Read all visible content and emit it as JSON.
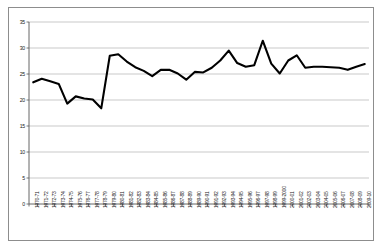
{
  "chart_data": {
    "type": "line",
    "title": "",
    "subtitle": "",
    "xlabel": "",
    "ylabel": "",
    "ylim": [
      0,
      35
    ],
    "yticks": [
      0,
      5,
      10,
      15,
      20,
      25,
      30,
      35
    ],
    "grid": true,
    "legend": false,
    "legend_position": "none",
    "line_color": "#000000",
    "grid_color": "#b3b3b3",
    "axis_color": "#808080",
    "plot_background": "#ffffff",
    "categories": [
      "1970-71",
      "1971-72",
      "1972-73",
      "1973-74",
      "1974-75",
      "1975-76",
      "1976-77",
      "1977-78",
      "1978-79",
      "1979-80",
      "1980-81",
      "1981-82",
      "1982-83",
      "1983-84",
      "1984-85",
      "1985-86",
      "1986-87",
      "1987-88",
      "1988-89",
      "1989-90",
      "1990-91",
      "1991-92",
      "1992-93",
      "1993-94",
      "1994-95",
      "1995-96",
      "1996-97",
      "1997-98",
      "1998-99",
      "1999-2000",
      "2000-01",
      "2001-02",
      "2002-03",
      "2003-04",
      "2004-05",
      "2005-06",
      "2006-07",
      "2007-08",
      "2008-09",
      "2009-10"
    ],
    "values": [
      23.4,
      24.1,
      23.6,
      23.1,
      19.3,
      20.7,
      20.3,
      20.1,
      18.4,
      28.5,
      28.8,
      27.4,
      26.3,
      25.6,
      24.6,
      25.8,
      25.8,
      25.1,
      23.9,
      25.4,
      25.3,
      26.2,
      27.6,
      29.5,
      27.1,
      26.4,
      26.7,
      31.4,
      27.0,
      25.1,
      27.6,
      28.6,
      26.2,
      26.4,
      26.4,
      26.3,
      26.2,
      25.8,
      26.4,
      26.9
    ]
  }
}
